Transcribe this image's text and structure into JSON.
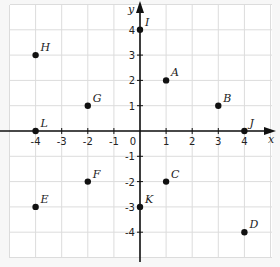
{
  "chart_data": {
    "type": "scatter",
    "title": "",
    "xlabel": "x",
    "ylabel": "y",
    "xlim": [
      -5,
      5
    ],
    "ylim": [
      -5,
      5
    ],
    "grid": true,
    "x_ticks": [
      -4,
      -3,
      -2,
      -1,
      0,
      1,
      2,
      3,
      4
    ],
    "y_ticks": [
      4,
      3,
      2,
      1,
      -1,
      -2,
      -3,
      -4
    ],
    "points": [
      {
        "label": "A",
        "x": 1,
        "y": 2
      },
      {
        "label": "B",
        "x": 3,
        "y": 1
      },
      {
        "label": "C",
        "x": 1,
        "y": -2
      },
      {
        "label": "D",
        "x": 4,
        "y": -4
      },
      {
        "label": "E",
        "x": -4,
        "y": -3
      },
      {
        "label": "F",
        "x": -2,
        "y": -2
      },
      {
        "label": "G",
        "x": -2,
        "y": 1
      },
      {
        "label": "H",
        "x": -4,
        "y": 3
      },
      {
        "label": "I",
        "x": 0,
        "y": 4
      },
      {
        "label": "J",
        "x": 4,
        "y": 0
      },
      {
        "label": "K",
        "x": 0,
        "y": -3
      },
      {
        "label": "L",
        "x": -4,
        "y": 0
      }
    ]
  },
  "colors": {
    "background": "#f7f7f7",
    "grid_bg": "#ffffff",
    "grid_line": "#dcdcdc",
    "axis": "#111111",
    "point": "#111111"
  }
}
